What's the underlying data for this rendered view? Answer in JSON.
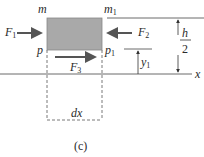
{
  "labels": {
    "m": "m",
    "m1": "m",
    "m1_sub": "1",
    "p": "p",
    "p1": "p",
    "p1_sub": "1",
    "F1": "F",
    "F1_sub": "1",
    "F2": "F",
    "F2_sub": "2",
    "F3": "F",
    "F3_sub": "3",
    "y1": "y",
    "y1_sub": "1",
    "h": "h",
    "two": "2",
    "x": "x",
    "dx": "dx",
    "caption": "(c)"
  },
  "colors": {
    "box_fill": "#a9a9a9",
    "box_stroke": "#7a7a7a",
    "arrow": "#555555",
    "line": "#444444"
  }
}
